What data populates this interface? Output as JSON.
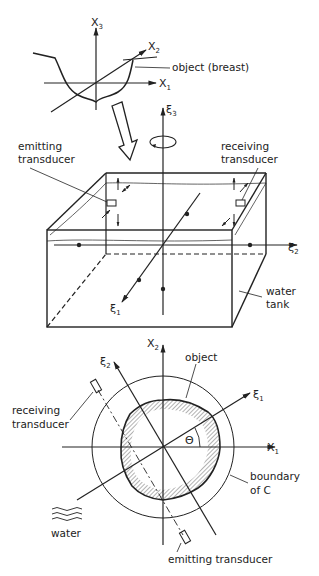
{
  "top_sketch": {
    "axes": {
      "x1": {
        "base": "X",
        "sub": "1"
      },
      "x2": {
        "base": "X",
        "sub": "2"
      },
      "x3": {
        "base": "X",
        "sub": "3"
      }
    },
    "object_label": "object (breast)"
  },
  "tank_view": {
    "axes": {
      "xi1": {
        "base": "ξ",
        "sub": "1"
      },
      "xi2": {
        "base": "ξ",
        "sub": "2"
      },
      "xi3": {
        "base": "ξ",
        "sub": "3"
      }
    },
    "emitting_label": [
      "emitting",
      "transducer"
    ],
    "receiving_label": [
      "receiving",
      "transducer"
    ],
    "tank_label": [
      "water",
      "tank"
    ]
  },
  "cross_section": {
    "axes": {
      "x1": {
        "base": "X",
        "sub": "1"
      },
      "x2": {
        "base": "X",
        "sub": "2"
      },
      "xi1": {
        "base": "ξ",
        "sub": "1"
      },
      "xi2": {
        "base": "ξ",
        "sub": "2"
      }
    },
    "angle_label": "Θ",
    "object_label": "object",
    "receiving_label": [
      "receiving",
      "transducer"
    ],
    "boundary_label": [
      "boundary",
      "of C"
    ],
    "water_label": "water",
    "emitting_label": "emitting transducer"
  },
  "colors": {
    "ink": "#222222",
    "background": "#ffffff",
    "hatch": "#555555"
  }
}
